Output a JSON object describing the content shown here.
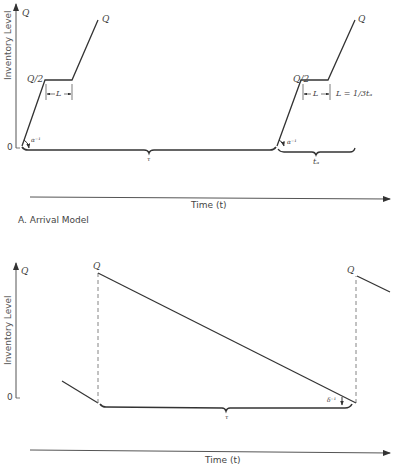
{
  "panel_a": {
    "y_axis_label": "Inventory Level",
    "y_top_label": "Q",
    "y_zero_label": "0",
    "q_top_label": "Q",
    "q_half_label": "Q/2",
    "lag_label": "L",
    "slope_label": "α⁻¹",
    "period_label": "τ",
    "arrival_period_label": "tₐ",
    "lag_formula": "L = 1/3tₐ",
    "x_axis_label": "Time (t)",
    "caption": "A.   Arrival Model"
  },
  "panel_b": {
    "y_axis_label": "Inventory Level",
    "y_top_label": "Q",
    "y_zero_label": "0",
    "peak_label_left": "Q",
    "peak_label_right": "Q",
    "slope_label": "δ⁻¹",
    "period_label": "τ",
    "x_axis_label": "Time (t)"
  },
  "colors": {
    "line": "#333333",
    "axis": "#555555",
    "dash": "#777777"
  }
}
